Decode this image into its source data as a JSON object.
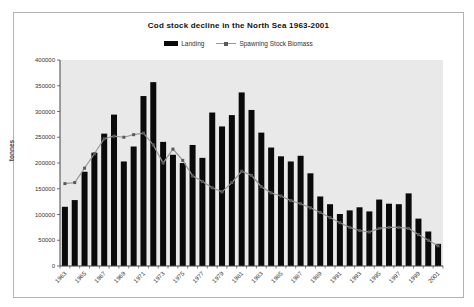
{
  "figure": {
    "title": "Cod stock decline in the North Sea 1963-2001"
  },
  "chart_data": {
    "type": "bar",
    "subtype": "bar-with-line-overlay",
    "title": "Cod stock decline in the North Sea 1963-2001",
    "xlabel": "",
    "ylabel": "tonnes",
    "ylim": [
      0,
      400000
    ],
    "ytick_labels": [
      "0",
      "50000",
      "100000",
      "150000",
      "200000",
      "250000",
      "300000",
      "350000",
      "400000"
    ],
    "x": [
      1963,
      1964,
      1965,
      1966,
      1967,
      1968,
      1969,
      1970,
      1971,
      1972,
      1973,
      1974,
      1975,
      1976,
      1977,
      1978,
      1979,
      1980,
      1981,
      1982,
      1983,
      1984,
      1985,
      1986,
      1987,
      1988,
      1989,
      1990,
      1991,
      1992,
      1993,
      1994,
      1995,
      1996,
      1997,
      1998,
      1999,
      2000,
      2001
    ],
    "xtick_labels": [
      "1963",
      "1965",
      "1967",
      "1969",
      "1971",
      "1973",
      "1975",
      "1977",
      "1979",
      "1981",
      "1983",
      "1985",
      "1987",
      "1989",
      "1991",
      "1993",
      "1995",
      "1997",
      "1999",
      "2001"
    ],
    "grid": false,
    "legend_position": "top-center",
    "plot_bg_color": "#e9e9e9",
    "series": [
      {
        "name": "Landing",
        "type": "bar",
        "color": "#0a0a0a",
        "values": [
          115000,
          128000,
          183000,
          220000,
          257000,
          294000,
          203000,
          232000,
          330000,
          357000,
          241000,
          216000,
          200000,
          235000,
          210000,
          298000,
          271000,
          293000,
          337000,
          303000,
          259000,
          230000,
          213000,
          203000,
          214000,
          180000,
          135000,
          120000,
          101000,
          108000,
          114000,
          106000,
          129000,
          121000,
          120000,
          141000,
          92000,
          67000,
          43000
        ]
      },
      {
        "name": "Spawning Stock Biomass",
        "type": "line",
        "color": "#999999",
        "marker": "square",
        "marker_color": "#5a5a5a",
        "values": [
          160000,
          162000,
          190000,
          218000,
          247000,
          252000,
          250000,
          255000,
          258000,
          235000,
          200000,
          227000,
          205000,
          175000,
          164000,
          152000,
          144000,
          162000,
          184000,
          176000,
          154000,
          142000,
          136000,
          127000,
          121000,
          113000,
          104000,
          94000,
          84000,
          75000,
          69000,
          66000,
          73000,
          75000,
          75000,
          73000,
          61000,
          50000,
          39000
        ]
      }
    ]
  }
}
